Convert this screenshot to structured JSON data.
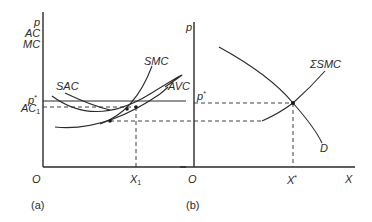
{
  "panel_a": {
    "caption": "(a)",
    "y_axis_labels": [
      "p",
      "AC",
      "MC"
    ],
    "origin": "O",
    "x_tick": "X",
    "x_tick_sub": "1",
    "p_star": "p",
    "p_star_sup": "*",
    "ac1": "AC",
    "ac1_sub": "1",
    "curves": {
      "sac": "SAC",
      "smc": "SMC",
      "avc": "AVC"
    }
  },
  "panel_b": {
    "caption": "(b)",
    "y_axis_label": "p",
    "origin": "O",
    "x_axis_label": "X",
    "x_star": "X",
    "x_star_sup": "*",
    "p_star": "p",
    "p_star_sup": "*",
    "curves": {
      "supply": "ΣSMC",
      "demand": "D"
    }
  },
  "colors": {
    "ink": "#2a2a2a",
    "background": "#ffffff"
  }
}
